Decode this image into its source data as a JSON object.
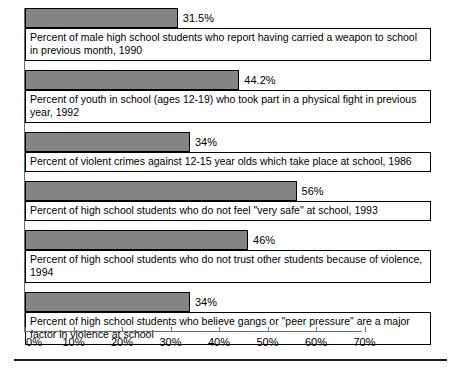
{
  "chart_data": {
    "type": "bar",
    "orientation": "horizontal",
    "title": "",
    "subtitle": "",
    "xlabel": "",
    "ylabel": "",
    "xlim": [
      0,
      70
    ],
    "grid": false,
    "legend": null,
    "axis_unit": "%",
    "tick_labels": [
      "0%",
      "10%",
      "20%",
      "30%",
      "40%",
      "50%",
      "60%",
      "70%"
    ],
    "tick_values": [
      0,
      10,
      20,
      30,
      40,
      50,
      60,
      70
    ],
    "categories": [
      "Percent of male high school students who report having carried a weapon to school in previous month, 1990",
      "Percent of youth in school (ages 12-19)  who took part in a physical fight in previous year, 1992",
      "Percent of violent crimes against 12-15 year olds which take place at school, 1986",
      "Percent of high school students who do not feel \"very safe\" at school, 1993",
      "Percent of high school students who do not trust other students because of violence, 1994",
      "Percent of high school students who believe gangs or \"peer pressure\" are a major factor in violence at school"
    ],
    "values": [
      31.5,
      44.2,
      34,
      56,
      46,
      34
    ],
    "value_labels": [
      "31.5%",
      "44.2%",
      "34%",
      "56%",
      "46%",
      "34%"
    ],
    "bar_color": "#858585",
    "bar_border_color": "#000000",
    "axis_color": "#6d6d6d",
    "text_color": "#000000"
  },
  "rows": [
    {
      "value": 31.5,
      "value_label": "31.5%",
      "description": "Percent of male high school students who report having carried a weapon to school in previous month, 1990"
    },
    {
      "value": 44.2,
      "value_label": "44.2%",
      "description": "Percent of youth in school (ages 12-19)  who took part in a physical fight in previous year, 1992"
    },
    {
      "value": 34,
      "value_label": "34%",
      "description": "Percent of violent crimes against 12-15 year olds which take place at school, 1986"
    },
    {
      "value": 56,
      "value_label": "56%",
      "description": "Percent of high school students who do not feel \"very safe\" at school, 1993"
    },
    {
      "value": 46,
      "value_label": "46%",
      "description": "Percent of high school students who do not trust other students because of violence, 1994"
    },
    {
      "value": 34,
      "value_label": "34%",
      "description": "Percent of high school students who believe gangs or \"peer pressure\" are a major factor in violence at school"
    }
  ],
  "x_axis": {
    "ticks": [
      {
        "label": "0%",
        "value": 0
      },
      {
        "label": "10%",
        "value": 10
      },
      {
        "label": "20%",
        "value": 20
      },
      {
        "label": "30%",
        "value": 30
      },
      {
        "label": "40%",
        "value": 40
      },
      {
        "label": "50%",
        "value": 50
      },
      {
        "label": "60%",
        "value": 60
      },
      {
        "label": "70%",
        "value": 70
      }
    ]
  }
}
